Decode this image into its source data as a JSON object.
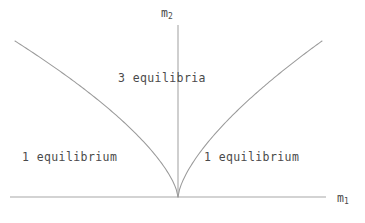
{
  "figure": {
    "type": "cusp-bifurcation-diagram",
    "background_color": "#ffffff",
    "line_color": "#9a9a9a",
    "text_color": "#4a4a4a"
  },
  "axes": {
    "x_axis": {
      "name": "m1",
      "label_text": "m",
      "label_subscript": "1",
      "x_start": 10,
      "x_end": 326,
      "y": 197
    },
    "y_axis": {
      "name": "m2",
      "label_text": "m",
      "label_subscript": "2",
      "x": 178,
      "y_start": 25,
      "y_end": 197
    }
  },
  "regions": [
    {
      "id": "three-equilibria",
      "label": "3 equilibria",
      "x": 118,
      "y": 73
    },
    {
      "id": "one-equilibrium-left",
      "label": "1 equilibrium",
      "x": 22,
      "y": 152
    },
    {
      "id": "one-equilibrium-right",
      "label": "1 equilibrium",
      "x": 204,
      "y": 152
    }
  ],
  "chart_data": {
    "type": "line",
    "title": "",
    "xlabel": "m1",
    "ylabel": "m2",
    "cusp_point": {
      "x": 178,
      "y": 197
    },
    "exponent": 0.6667,
    "series": [
      {
        "name": "left-branch",
        "points": [
          [
            178,
            197
          ],
          [
            176,
            191
          ],
          [
            174,
            188
          ],
          [
            172,
            185
          ],
          [
            170,
            183
          ],
          [
            167,
            180
          ],
          [
            164,
            177
          ],
          [
            160,
            173
          ],
          [
            155,
            169
          ],
          [
            150,
            165
          ],
          [
            144,
            160
          ],
          [
            137,
            155
          ],
          [
            129,
            149
          ],
          [
            120,
            142
          ],
          [
            110,
            134
          ],
          [
            99,
            125
          ],
          [
            87,
            115
          ],
          [
            74,
            104
          ],
          [
            60,
            92
          ],
          [
            45,
            78
          ],
          [
            30,
            62
          ],
          [
            15,
            41
          ]
        ]
      },
      {
        "name": "right-branch",
        "points": [
          [
            178,
            197
          ],
          [
            180,
            191
          ],
          [
            182,
            188
          ],
          [
            184,
            185
          ],
          [
            186,
            183
          ],
          [
            189,
            180
          ],
          [
            192,
            177
          ],
          [
            196,
            173
          ],
          [
            201,
            169
          ],
          [
            206,
            165
          ],
          [
            212,
            160
          ],
          [
            219,
            155
          ],
          [
            227,
            149
          ],
          [
            236,
            142
          ],
          [
            246,
            134
          ],
          [
            257,
            125
          ],
          [
            269,
            115
          ],
          [
            282,
            104
          ],
          [
            296,
            92
          ],
          [
            311,
            78
          ],
          [
            322,
            64
          ],
          [
            322,
            41
          ]
        ]
      }
    ],
    "grid": false,
    "legend": "none"
  }
}
